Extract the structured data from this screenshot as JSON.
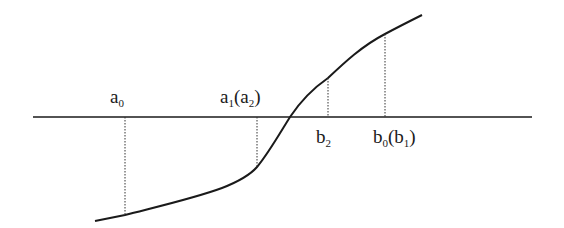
{
  "diagram": {
    "type": "bisection-method-illustration",
    "colors": {
      "background": "#ffffff",
      "stroke": "#1a1a1a",
      "dotted": "#333333"
    },
    "axis": {
      "x1": 33,
      "y": 117,
      "x2": 532
    },
    "curve_points": [
      [
        95,
        221
      ],
      [
        125,
        215
      ],
      [
        170,
        203
      ],
      [
        215,
        190
      ],
      [
        240,
        180
      ],
      [
        257,
        167
      ],
      [
        272,
        148
      ],
      [
        290,
        117
      ],
      [
        305,
        97
      ],
      [
        328,
        78
      ],
      [
        355,
        55
      ],
      [
        385,
        34
      ],
      [
        422,
        15
      ]
    ],
    "projections": [
      {
        "name": "a0",
        "x": 125,
        "y_top": 117,
        "y_bottom": 215
      },
      {
        "name": "a1",
        "x": 257,
        "y_top": 117,
        "y_bottom": 167
      },
      {
        "name": "b2",
        "x": 328,
        "y_top": 78,
        "y_bottom": 117
      },
      {
        "name": "b0",
        "x": 385,
        "y_top": 34,
        "y_bottom": 117
      }
    ],
    "labels": {
      "a0": {
        "base": "a",
        "sub": "0",
        "paren": ""
      },
      "a1a2": {
        "base": "a",
        "sub": "1",
        "paren_base": "a",
        "paren_sub": "2"
      },
      "b2": {
        "base": "b",
        "sub": "2"
      },
      "b0b1": {
        "base": "b",
        "sub": "0",
        "paren_base": "b",
        "paren_sub": "1"
      }
    }
  }
}
